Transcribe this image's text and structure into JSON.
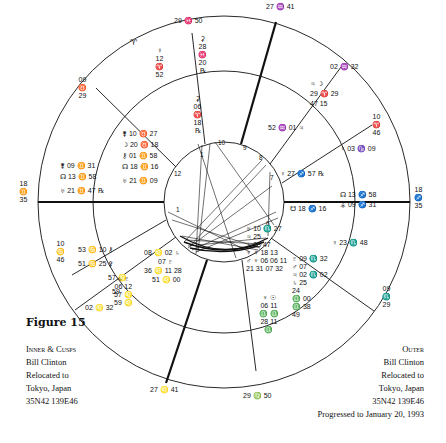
{
  "figure": {
    "title": "Figure 15",
    "inner_caption": [
      "Inner & Cusps",
      "Bill Clinton",
      "Relocated to",
      "Tokyo, Japan",
      "35N42 139E46"
    ],
    "outer_caption": [
      "Outer",
      "Bill Clinton",
      "Relocated to",
      "Tokyo, Japan",
      "35N42 139E46",
      "Progressed to January 20, 1993"
    ]
  },
  "cusps": {
    "mc": "27 ♒ 41",
    "ic": "27 ♌ 41",
    "asc": {
      "deg": "18",
      "sign": "♐",
      "min": "35"
    },
    "dsc": {
      "deg": "18",
      "sign": "♊",
      "min": "35"
    },
    "c11": "02 ♒ 32",
    "c12": {
      "deg": "10",
      "sign": "♈",
      "min": "46"
    },
    "c2": {
      "deg": "09",
      "sign": "♏",
      "min": "29"
    },
    "c3": "29 ♍ 50",
    "c5": "02 ♌ 32",
    "c6": {
      "deg": "10",
      "sign": "♋",
      "min": "46"
    },
    "c8": {
      "deg": "29",
      "sign": "♉",
      "min": "09"
    },
    "c9": "29 ♓ 50"
  },
  "outer_planets": {
    "top_aries": "♈",
    "top_mercury": [
      "☿",
      "12",
      "♈",
      "52"
    ],
    "top_ceres": [
      "⚳",
      "28",
      "♓",
      "20",
      "℞"
    ],
    "upper_right": {
      "moon": "☽",
      "jupiter": "♃",
      "mars1": "29 ♈ 29",
      "mars2": "47 15"
    },
    "right_venus": "♀ 03 ♑ 09",
    "right_node": "☊ 13 ♐ 58",
    "right_vesta": "⚶ 09 ♐ 31",
    "right_venus2": "♀ 23 ♏ 48",
    "lower_right": [
      "♇ 09 ♏ 32",
      "♂ 07",
      "♃ 02 ♏ 02",
      "♄ 25",
      "24",
      "♎ 00",
      "♎ 38",
      "49"
    ],
    "bottom": [
      "♆ ☉",
      "06 11",
      "♎ ♎",
      "28 11",
      "♎"
    ],
    "left_upper": [
      "⚵ 09 ♊ 31",
      "☊ 13 ♊ 58",
      "♅ 21 ♊ 47 ℞"
    ],
    "left_lower": [
      "53 ♋ 10 ⚷",
      "51 ♋ 25 ⚴",
      "57 ♌",
      "59"
    ]
  },
  "inner_planets": {
    "top_ceres": [
      "⚳",
      "06",
      "♈",
      "18",
      "℞"
    ],
    "top_left": [
      "⚵ 10 ♉ 27",
      "☽ 20 ♉ 18",
      "⚷ 01 ♊ 58",
      "☊ 18 ♊ 16",
      "♅ 21 ♊ 09"
    ],
    "top_right": [
      "52 ♒ 01 ♃",
      "♀ 27 ♐ 57 ℞",
      "☋ 18 ♐ 16"
    ],
    "right_lower": [
      "♅ 10 ♏ 27",
      "♃ 25",
      "♄ 23 47",
      "♆ ☿ 18 13",
      "♂ ♆ 06 06 11",
      "21 31 07 32"
    ],
    "left_lower": [
      "08 ♌ 02 ♄",
      "07 ♇",
      "36 ♌ 11 28",
      "51 ♌ 00"
    ],
    "left_saturn": [
      "♄ ♇",
      "06 12",
      "57 ♌",
      "59 ♌"
    ]
  },
  "houses": [
    "1",
    "2",
    "3",
    "4",
    "5",
    "6",
    "7",
    "8",
    "9",
    "10",
    "11",
    "12"
  ]
}
